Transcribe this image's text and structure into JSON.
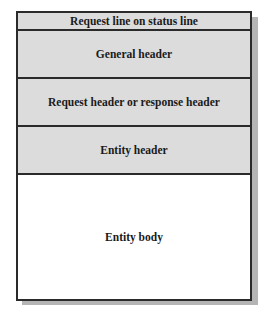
{
  "diagram": {
    "rows": [
      {
        "label": "Request line on status line",
        "height": 16,
        "fill": "#dcdcdc"
      },
      {
        "label": "General header",
        "height": 46,
        "fill": "#dcdcdc"
      },
      {
        "label": "Request header or response header",
        "height": 46,
        "fill": "#dcdcdc"
      },
      {
        "label": "Entity header",
        "height": 46,
        "fill": "#dcdcdc"
      },
      {
        "label": "Entity body",
        "height": 124,
        "fill": "#ffffff"
      }
    ]
  }
}
